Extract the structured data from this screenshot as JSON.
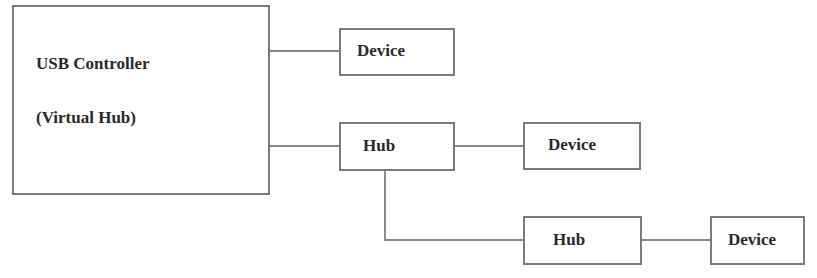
{
  "diagram": {
    "controller": {
      "line1": "USB Controller",
      "line2": "(Virtual Hub)"
    },
    "device1": {
      "label": "Device"
    },
    "hub1": {
      "label": "Hub"
    },
    "device2": {
      "label": "Device"
    },
    "hub2": {
      "label": "Hub"
    },
    "device3": {
      "label": "Device"
    },
    "colors": {
      "line": "#8a8a8a",
      "border": "#7a7a7a",
      "text": "#2a2a2a"
    }
  }
}
